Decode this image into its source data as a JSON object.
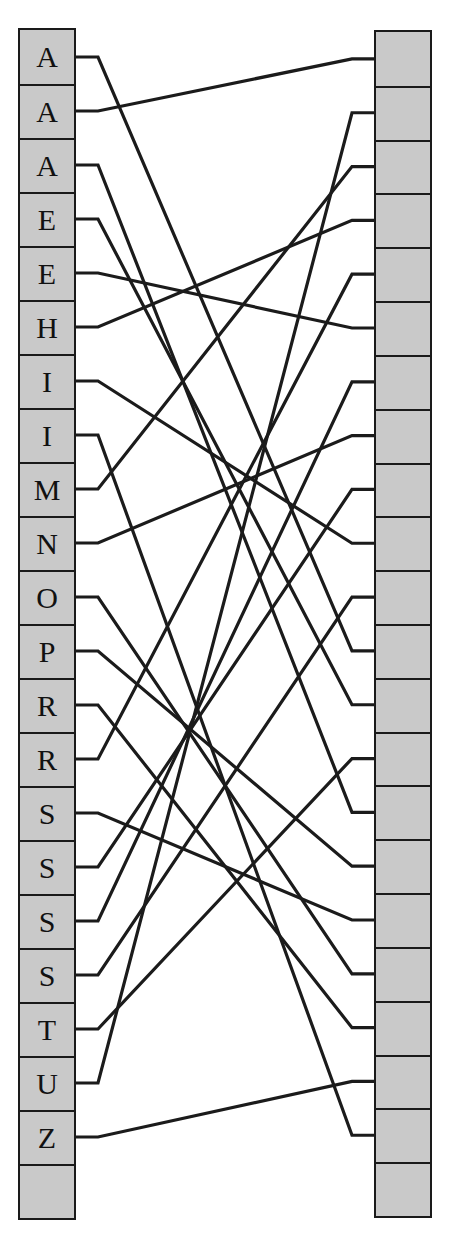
{
  "diagram": {
    "type": "bipartite-matching",
    "title": "",
    "left_column": {
      "name": "left-node-column",
      "x": 18,
      "y": 28,
      "width": 58,
      "height": 1192,
      "cell_count": 22,
      "fill_color": "#c9c9c9",
      "border_color": "#1a1a1a",
      "labels": [
        "A",
        "A",
        "A",
        "E",
        "E",
        "H",
        "I",
        "I",
        "M",
        "N",
        "O",
        "P",
        "R",
        "R",
        "S",
        "S",
        "S",
        "S",
        "T",
        "U",
        "Z",
        ""
      ]
    },
    "right_column": {
      "name": "right-node-column",
      "x": 374,
      "y": 30,
      "width": 58,
      "height": 1188,
      "cell_count": 22,
      "fill_color": "#c9c9c9",
      "border_color": "#1a1a1a",
      "labels": [
        "",
        "",
        "",
        "",
        "",
        "",
        "",
        "",
        "",
        "",
        "",
        "",
        "",
        "",
        "",
        "",
        "",
        "",
        "",
        "",
        "",
        ""
      ]
    },
    "edges": {
      "name": "matching-edges",
      "stroke_color": "#1b1b1b",
      "stroke_width": 3.2,
      "stub_length": 22,
      "count": 21,
      "pairs": [
        [
          0,
          11
        ],
        [
          1,
          0
        ],
        [
          2,
          14
        ],
        [
          3,
          12
        ],
        [
          4,
          5
        ],
        [
          5,
          3
        ],
        [
          6,
          9
        ],
        [
          7,
          20
        ],
        [
          8,
          2
        ],
        [
          9,
          7
        ],
        [
          10,
          17
        ],
        [
          11,
          15
        ],
        [
          12,
          18
        ],
        [
          13,
          4
        ],
        [
          14,
          16
        ],
        [
          15,
          8
        ],
        [
          16,
          6
        ],
        [
          17,
          10
        ],
        [
          18,
          13
        ],
        [
          19,
          1
        ],
        [
          20,
          19
        ]
      ]
    }
  }
}
